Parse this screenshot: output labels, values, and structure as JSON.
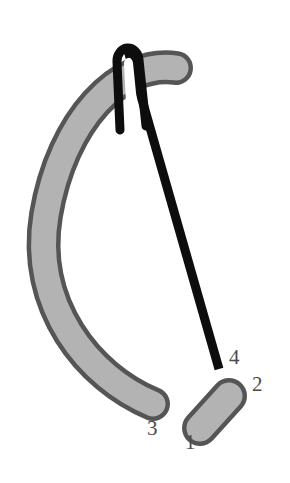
{
  "figure": {
    "name": "suture-needle-and-clip-diagram",
    "background_color": "#ffffff",
    "width": 290,
    "height": 483,
    "parts": {
      "crescent_band": {
        "name": "curved-gray-band",
        "fill_color": "#b3b3b3",
        "stroke_color": "#555555",
        "stroke_width": 5
      },
      "needle": {
        "name": "black-needle",
        "fill_color": "#0d0d0d",
        "eye_fill_color": "#ffffff"
      },
      "small_capsule": {
        "name": "small-gray-capsule",
        "fill_color": "#b3b3b3",
        "stroke_color": "#555555",
        "stroke_width": 5
      }
    }
  },
  "labels": {
    "color": "#4a4a4a",
    "items": [
      {
        "id": "label-1",
        "text": "1"
      },
      {
        "id": "label-2",
        "text": "2"
      },
      {
        "id": "label-3",
        "text": "3"
      },
      {
        "id": "label-4",
        "text": "4"
      }
    ]
  }
}
